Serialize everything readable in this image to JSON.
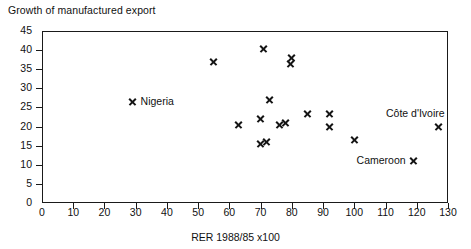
{
  "chart_data": {
    "type": "scatter",
    "title": "Growth of manufactured export",
    "xlabel": "RER 1988/85 x100",
    "ylabel": "",
    "xlim": [
      0,
      130
    ],
    "ylim": [
      0,
      45
    ],
    "xticks": [
      0,
      10,
      20,
      30,
      40,
      50,
      60,
      70,
      80,
      90,
      100,
      110,
      120,
      130
    ],
    "yticks": [
      0,
      5,
      10,
      15,
      20,
      25,
      30,
      35,
      40,
      45
    ],
    "grid": false,
    "legend": "none",
    "marker": "x",
    "marker_color": "#151515",
    "points": [
      {
        "x": 29,
        "y": 26.5,
        "label": "Nigeria",
        "label_pos": "right"
      },
      {
        "x": 55,
        "y": 37,
        "label": "",
        "label_pos": ""
      },
      {
        "x": 71,
        "y": 40.5,
        "label": "",
        "label_pos": ""
      },
      {
        "x": 80,
        "y": 38,
        "label": "",
        "label_pos": ""
      },
      {
        "x": 79.5,
        "y": 36.5,
        "label": "",
        "label_pos": ""
      },
      {
        "x": 73,
        "y": 27,
        "label": "",
        "label_pos": ""
      },
      {
        "x": 70,
        "y": 22,
        "label": "",
        "label_pos": ""
      },
      {
        "x": 63,
        "y": 20.5,
        "label": "",
        "label_pos": ""
      },
      {
        "x": 76,
        "y": 20.5,
        "label": "",
        "label_pos": ""
      },
      {
        "x": 78,
        "y": 21,
        "label": "",
        "label_pos": ""
      },
      {
        "x": 85,
        "y": 23.5,
        "label": "",
        "label_pos": ""
      },
      {
        "x": 92,
        "y": 23.5,
        "label": "",
        "label_pos": ""
      },
      {
        "x": 92,
        "y": 20,
        "label": "",
        "label_pos": ""
      },
      {
        "x": 70,
        "y": 15.5,
        "label": "",
        "label_pos": ""
      },
      {
        "x": 72,
        "y": 16,
        "label": "",
        "label_pos": ""
      },
      {
        "x": 100,
        "y": 16.5,
        "label": "",
        "label_pos": ""
      },
      {
        "x": 127,
        "y": 20,
        "label": "Côte d'Ivoire",
        "label_pos": "above"
      },
      {
        "x": 119,
        "y": 11,
        "label": "Cameroon",
        "label_pos": "left"
      }
    ]
  }
}
